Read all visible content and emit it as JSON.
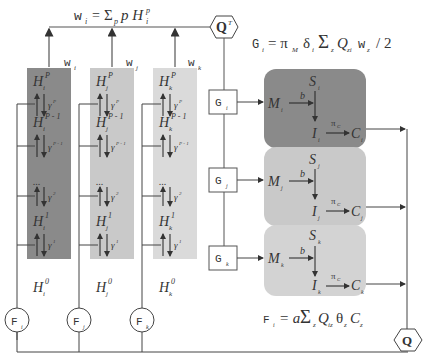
{
  "diagram": {
    "formulas": {
      "w": {
        "lhs": "w",
        "sub": "i",
        "rhs_sum": "Σ",
        "rhs_sum_sub": "p",
        "rhs_term": "p H",
        "rhs_sup": "p",
        "rhs_sub": "i"
      },
      "g": {
        "text_lhs": "G",
        "sub": "i",
        "rhs": "= π",
        "rhs_pi_sub": "M",
        "rhs_delta": "δ",
        "rhs_delta_sub": "i",
        "rhs_sum": "Σ",
        "rhs_sum_sub": "z",
        "rhs_q": "Q",
        "rhs_q_sub": "zi",
        "rhs_w": "w",
        "rhs_w_sub": "z",
        "rhs_tail": "/ 2"
      },
      "f": {
        "lhs": "F",
        "sub": "i",
        "rhs": "= a",
        "rhs_sum": "Σ",
        "rhs_sum_sub": "z",
        "rhs_q": "Q",
        "rhs_q_sub": "iz",
        "rhs_theta": "θ",
        "rhs_theta_sub": "z",
        "rhs_c": "C",
        "rhs_c_sub": "z"
      }
    },
    "hexagons": {
      "qt": {
        "label": "Q",
        "sup": "T"
      },
      "q": {
        "label": "Q"
      }
    },
    "columns": [
      {
        "id": "i",
        "w_label": "w",
        "w_sub": "i",
        "color": "#8a8a8a",
        "f_label": "F",
        "f_sub": "i",
        "levels": [
          "H^P",
          "H^{P-1}",
          "...",
          "H^1",
          "H^0"
        ],
        "gammas": [
          "γ^P",
          "γ^{P-1}",
          "γ^2",
          "γ^1"
        ]
      },
      {
        "id": "j",
        "w_label": "w",
        "w_sub": "j",
        "color": "#c9c9c9",
        "f_label": "F",
        "f_sub": "j"
      },
      {
        "id": "k",
        "w_label": "w",
        "w_sub": "k",
        "color": "#dadada",
        "f_label": "F",
        "f_sub": "k"
      }
    ],
    "level_text": {
      "H": "H",
      "P": "P",
      "Pm1": "P - 1",
      "one": "1",
      "zero": "0",
      "dots": "...",
      "gamma": "γ",
      "gP": "P",
      "gPm1": "P - 1",
      "g2": "2",
      "g1": "1"
    },
    "g_boxes": [
      {
        "label": "G",
        "sub": "i"
      },
      {
        "label": "G",
        "sub": "j"
      },
      {
        "label": "G",
        "sub": "k"
      }
    ],
    "sectors": [
      {
        "id": "i",
        "color": "#8a8a8a",
        "S": "S",
        "M": "M",
        "b": "b",
        "I": "I",
        "pi": "π",
        "pi_sub": "C",
        "C": "C"
      },
      {
        "id": "j",
        "color": "#c9c9c9",
        "S": "S",
        "M": "M",
        "b": "b",
        "I": "I",
        "pi": "π",
        "pi_sub": "C",
        "C": "C"
      },
      {
        "id": "k",
        "color": "#d3d3d3",
        "S": "S",
        "M": "M",
        "b": "b",
        "I": "I",
        "pi": "π",
        "pi_sub": "C",
        "C": "C"
      }
    ]
  }
}
